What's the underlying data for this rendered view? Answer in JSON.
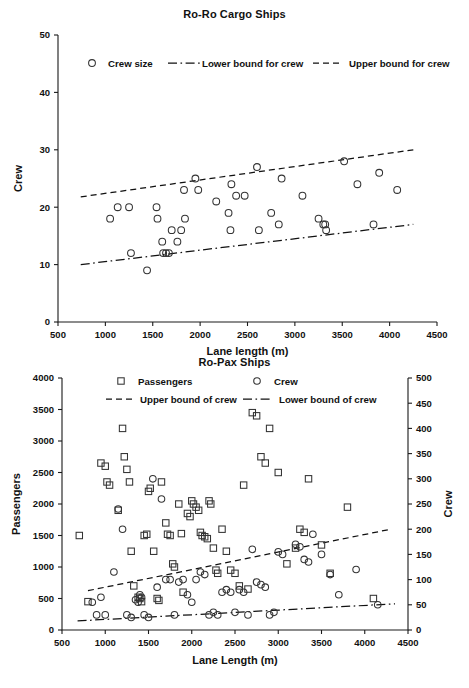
{
  "figures": [
    {
      "id": "roro",
      "title": "Ro-Ro Cargo Ships",
      "legend": [
        {
          "label": "Crew size",
          "marker": "circle-marker"
        },
        {
          "label": "Lower bound for crew",
          "marker": "dash-dot-line"
        },
        {
          "label": "Upper bound for crew",
          "marker": "dashed-line"
        }
      ]
    },
    {
      "id": "ropax",
      "title": "Ro-Pax Ships",
      "legend": [
        {
          "label": "Passengers",
          "marker": "square-marker"
        },
        {
          "label": "Crew",
          "marker": "circle-marker"
        },
        {
          "label": "Upper bound of crew",
          "marker": "dashed-line"
        },
        {
          "label": "Lower bound of crew",
          "marker": "dash-dot-line"
        }
      ]
    }
  ],
  "chart_data": [
    {
      "type": "scatter",
      "title": "Ro-Ro Cargo Ships",
      "xlabel": "Lane length (m)",
      "ylabel": "Crew",
      "xlim": [
        500,
        4500
      ],
      "ylim": [
        0,
        50
      ],
      "xticks": [
        500,
        1000,
        1500,
        2000,
        2500,
        3000,
        3500,
        4000,
        4500
      ],
      "yticks": [
        0,
        10,
        20,
        30,
        40,
        50
      ],
      "grid": false,
      "legend_position": "top-inside",
      "series": [
        {
          "name": "Crew size",
          "marker": "circle",
          "points": [
            [
              1050,
              18
            ],
            [
              1130,
              20
            ],
            [
              1250,
              20
            ],
            [
              1270,
              12
            ],
            [
              1440,
              9
            ],
            [
              1540,
              20
            ],
            [
              1550,
              18
            ],
            [
              1600,
              14
            ],
            [
              1610,
              12
            ],
            [
              1640,
              12
            ],
            [
              1670,
              12
            ],
            [
              1700,
              16
            ],
            [
              1760,
              14
            ],
            [
              1800,
              16
            ],
            [
              1830,
              23
            ],
            [
              1840,
              18
            ],
            [
              1950,
              25
            ],
            [
              1980,
              23
            ],
            [
              2170,
              21
            ],
            [
              2300,
              19
            ],
            [
              2320,
              16
            ],
            [
              2330,
              24
            ],
            [
              2380,
              22
            ],
            [
              2470,
              22
            ],
            [
              2600,
              27
            ],
            [
              2620,
              16
            ],
            [
              2750,
              19
            ],
            [
              2830,
              17
            ],
            [
              2860,
              25
            ],
            [
              3080,
              22
            ],
            [
              3250,
              18
            ],
            [
              3300,
              17
            ],
            [
              3320,
              17
            ],
            [
              3330,
              16
            ],
            [
              3520,
              28
            ],
            [
              3660,
              24
            ],
            [
              3830,
              17
            ],
            [
              3890,
              26
            ],
            [
              4080,
              23
            ]
          ]
        }
      ],
      "bounds": [
        {
          "name": "Upper bound for crew",
          "style": "dashed",
          "x": [
            740,
            4250
          ],
          "y": [
            21.8,
            30.0
          ]
        },
        {
          "name": "Lower bound for crew",
          "style": "dash-dot",
          "x": [
            740,
            4250
          ],
          "y": [
            10.0,
            17.0
          ]
        }
      ]
    },
    {
      "type": "scatter",
      "title": "Ro-Pax Ships",
      "xlabel": "Lane Length (m)",
      "ylabel": "Passengers",
      "y2label": "Crew",
      "xlim": [
        500,
        4500
      ],
      "ylim": [
        0,
        4000
      ],
      "y2lim": [
        0,
        500
      ],
      "xticks": [
        500,
        1000,
        1500,
        2000,
        2500,
        3000,
        3500,
        4000,
        4500
      ],
      "yticks": [
        0,
        500,
        1000,
        1500,
        2000,
        2500,
        3000,
        3500,
        4000
      ],
      "y2ticks": [
        0,
        50,
        100,
        150,
        200,
        250,
        300,
        350,
        400,
        450,
        500
      ],
      "grid": false,
      "legend_position": "top-inside",
      "series": [
        {
          "name": "Passengers",
          "marker": "square",
          "axis": "left",
          "points": [
            [
              700,
              1500
            ],
            [
              800,
              450
            ],
            [
              950,
              2650
            ],
            [
              1000,
              2600
            ],
            [
              1020,
              2350
            ],
            [
              1050,
              2300
            ],
            [
              1150,
              1900
            ],
            [
              1200,
              3200
            ],
            [
              1220,
              2750
            ],
            [
              1250,
              2550
            ],
            [
              1280,
              2350
            ],
            [
              1300,
              1250
            ],
            [
              1330,
              700
            ],
            [
              1380,
              520
            ],
            [
              1400,
              500
            ],
            [
              1420,
              450
            ],
            [
              1450,
              1500
            ],
            [
              1480,
              1520
            ],
            [
              1500,
              2200
            ],
            [
              1520,
              2250
            ],
            [
              1560,
              1250
            ],
            [
              1600,
              500
            ],
            [
              1620,
              470
            ],
            [
              1650,
              2350
            ],
            [
              1700,
              1700
            ],
            [
              1720,
              1520
            ],
            [
              1750,
              1500
            ],
            [
              1780,
              1050
            ],
            [
              1800,
              1000
            ],
            [
              1850,
              2000
            ],
            [
              1880,
              1530
            ],
            [
              1900,
              600
            ],
            [
              1950,
              1850
            ],
            [
              1980,
              1800
            ],
            [
              2000,
              2050
            ],
            [
              2020,
              2000
            ],
            [
              2050,
              1950
            ],
            [
              2080,
              1900
            ],
            [
              2100,
              1550
            ],
            [
              2120,
              1500
            ],
            [
              2150,
              1480
            ],
            [
              2180,
              1450
            ],
            [
              2200,
              2050
            ],
            [
              2220,
              2000
            ],
            [
              2250,
              1300
            ],
            [
              2280,
              950
            ],
            [
              2300,
              900
            ],
            [
              2350,
              1600
            ],
            [
              2400,
              1250
            ],
            [
              2450,
              950
            ],
            [
              2500,
              900
            ],
            [
              2550,
              700
            ],
            [
              2600,
              2300
            ],
            [
              2650,
              650
            ],
            [
              2700,
              3450
            ],
            [
              2750,
              3400
            ],
            [
              2800,
              2750
            ],
            [
              2850,
              2650
            ],
            [
              2900,
              3200
            ],
            [
              3000,
              2500
            ],
            [
              3100,
              1050
            ],
            [
              3200,
              1300
            ],
            [
              3250,
              1600
            ],
            [
              3300,
              1550
            ],
            [
              3350,
              2400
            ],
            [
              3500,
              1350
            ],
            [
              3600,
              900
            ],
            [
              3800,
              1950
            ],
            [
              4100,
              500
            ]
          ]
        },
        {
          "name": "Crew",
          "marker": "circle",
          "axis": "right",
          "points": [
            [
              850,
              55
            ],
            [
              900,
              30
            ],
            [
              950,
              65
            ],
            [
              1000,
              30
            ],
            [
              1100,
              115
            ],
            [
              1150,
              240
            ],
            [
              1200,
              200
            ],
            [
              1250,
              30
            ],
            [
              1300,
              25
            ],
            [
              1350,
              60
            ],
            [
              1380,
              55
            ],
            [
              1400,
              70
            ],
            [
              1420,
              65
            ],
            [
              1450,
              30
            ],
            [
              1500,
              25
            ],
            [
              1550,
              300
            ],
            [
              1600,
              85
            ],
            [
              1650,
              260
            ],
            [
              1700,
              100
            ],
            [
              1750,
              100
            ],
            [
              1800,
              30
            ],
            [
              1850,
              95
            ],
            [
              1900,
              100
            ],
            [
              1950,
              70
            ],
            [
              2000,
              55
            ],
            [
              2050,
              100
            ],
            [
              2100,
              115
            ],
            [
              2150,
              110
            ],
            [
              2200,
              30
            ],
            [
              2250,
              35
            ],
            [
              2300,
              30
            ],
            [
              2350,
              75
            ],
            [
              2400,
              80
            ],
            [
              2450,
              75
            ],
            [
              2500,
              35
            ],
            [
              2550,
              80
            ],
            [
              2600,
              75
            ],
            [
              2650,
              30
            ],
            [
              2700,
              160
            ],
            [
              2750,
              95
            ],
            [
              2800,
              90
            ],
            [
              2850,
              85
            ],
            [
              2900,
              30
            ],
            [
              2950,
              35
            ],
            [
              3000,
              155
            ],
            [
              3050,
              150
            ],
            [
              3200,
              170
            ],
            [
              3250,
              165
            ],
            [
              3300,
              140
            ],
            [
              3350,
              135
            ],
            [
              3400,
              190
            ],
            [
              3500,
              150
            ],
            [
              3600,
              110
            ],
            [
              3700,
              70
            ],
            [
              3900,
              120
            ],
            [
              4150,
              50
            ]
          ]
        }
      ],
      "bounds": [
        {
          "name": "Upper bound of crew",
          "style": "dashed",
          "axis": "right",
          "x": [
            800,
            4300
          ],
          "y": [
            78,
            200
          ]
        },
        {
          "name": "Lower bound of crew",
          "style": "dash-dot",
          "axis": "right",
          "x": [
            680,
            4350
          ],
          "y": [
            18,
            52
          ]
        }
      ]
    }
  ]
}
